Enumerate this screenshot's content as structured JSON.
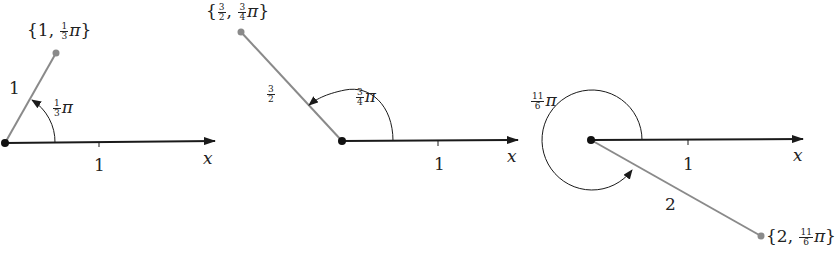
{
  "diagrams": [
    {
      "point": {
        "open": "{",
        "r": "1",
        "sep": ",",
        "theta_num": "1",
        "theta_den": "3",
        "pi": "π",
        "close": "}"
      },
      "length_label": "1",
      "angle_label": {
        "num": "1",
        "den": "3",
        "pi": "π"
      },
      "tick_label": "1",
      "axis_label": "x"
    },
    {
      "point": {
        "open": "{",
        "r_num": "3",
        "r_den": "2",
        "sep": ",",
        "theta_num": "3",
        "theta_den": "4",
        "pi": "π",
        "close": "}"
      },
      "length_label": {
        "num": "3",
        "den": "2"
      },
      "angle_label": {
        "num": "3",
        "den": "4",
        "pi": "π"
      },
      "tick_label": "1",
      "axis_label": "x"
    },
    {
      "point": {
        "open": "{",
        "r": "2",
        "sep": ",",
        "theta_num": "11",
        "theta_den": "6",
        "pi": "π",
        "close": "}"
      },
      "length_label": "2",
      "angle_label": {
        "num": "11",
        "den": "6",
        "pi": "π"
      },
      "tick_label": "1",
      "axis_label": "x"
    }
  ],
  "colors": {
    "axis": "#1a1a1a",
    "ray": "#8a8a8a",
    "point": "#8a8a8a",
    "origin": "#111111"
  }
}
